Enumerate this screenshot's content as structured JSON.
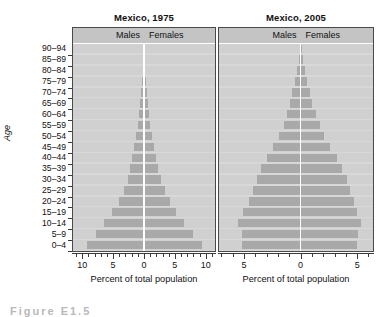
{
  "figure": {
    "y_axis_title": "Age",
    "caption_partial": "Figure  E1.5"
  },
  "panels": [
    {
      "id": "mexico-1975",
      "title": "Mexico, 1975",
      "males_label": "Males",
      "females_label": "Females",
      "x_axis_title": "Percent of total population",
      "x_ticks": [
        10,
        5,
        0,
        5,
        10
      ],
      "x_max": 11.5
    },
    {
      "id": "mexico-2005",
      "title": "Mexico, 2005",
      "males_label": "Males",
      "females_label": "Females",
      "x_axis_title": "Percent of total population",
      "x_ticks": [
        5,
        0,
        5
      ],
      "x_max": 6.4
    }
  ],
  "chart_data": {
    "type": "bar",
    "subtype": "population-pyramid",
    "xlabel": "Percent of total population",
    "ylabel": "Age",
    "grid": false,
    "legend_position": "top-strip",
    "categories": [
      "0–4",
      "5–9",
      "10–14",
      "15–19",
      "20–24",
      "25–29",
      "30–34",
      "35–39",
      "40–44",
      "45–49",
      "50–54",
      "55–59",
      "60–64",
      "65–69",
      "70–74",
      "75–79",
      "80–84",
      "85–89",
      "90–94"
    ],
    "charts": [
      {
        "name": "Mexico, 1975",
        "xlim": [
          -11.5,
          11.5
        ],
        "xticks": [
          10,
          5,
          0,
          5,
          10
        ],
        "series": [
          {
            "name": "Males",
            "side": "left",
            "values": [
              9.3,
              7.8,
              6.5,
              5.2,
              4.1,
              3.3,
              2.6,
              2.2,
              1.9,
              1.6,
              1.3,
              1.0,
              0.85,
              0.62,
              0.45,
              0.3,
              0.18,
              0.1,
              0.05
            ]
          },
          {
            "name": "Females",
            "side": "right",
            "values": [
              9.4,
              7.9,
              6.4,
              5.2,
              4.2,
              3.4,
              2.7,
              2.3,
              1.9,
              1.6,
              1.3,
              1.05,
              0.88,
              0.65,
              0.48,
              0.33,
              0.2,
              0.11,
              0.06
            ]
          }
        ]
      },
      {
        "name": "Mexico, 2005",
        "xlim": [
          -6.4,
          6.4
        ],
        "xticks": [
          5,
          0,
          5
        ],
        "series": [
          {
            "name": "Males",
            "side": "left",
            "values": [
              5.2,
              5.2,
              5.5,
              5.1,
              4.6,
              4.2,
              3.9,
              3.5,
              3.0,
              2.4,
              1.9,
              1.5,
              1.2,
              0.95,
              0.72,
              0.5,
              0.33,
              0.18,
              0.09
            ]
          },
          {
            "name": "Females",
            "side": "right",
            "values": [
              5.0,
              5.1,
              5.3,
              5.0,
              4.7,
              4.4,
              4.1,
              3.7,
              3.2,
              2.6,
              2.1,
              1.7,
              1.35,
              1.05,
              0.8,
              0.57,
              0.38,
              0.21,
              0.11
            ]
          }
        ]
      }
    ],
    "colors": {
      "bar": "#a9a9a9",
      "panel_background": "#d8d8d8",
      "row_background": "#d0d0d0",
      "header_strip": "#c4c4c4",
      "zero_line": "#ffffff",
      "axis": "#3a3a3a",
      "text": "#111111"
    }
  }
}
